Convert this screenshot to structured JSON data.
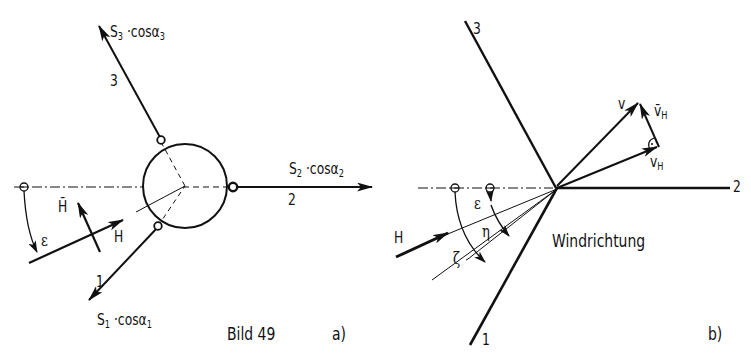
{
  "figure": {
    "caption": "Bild 49",
    "panel_a": {
      "tag": "a)",
      "members": [
        {
          "id": "3",
          "label": "3",
          "force_prefix": "S",
          "force_sub": "3",
          "force_mid": "·cosα",
          "force_sub2": "3"
        },
        {
          "id": "2",
          "label": "2",
          "force_prefix": "S",
          "force_sub": "2",
          "force_mid": "·cosα",
          "force_sub2": "2"
        },
        {
          "id": "1",
          "label": "1",
          "force_prefix": "S",
          "force_sub": "1",
          "force_mid": "·cosα",
          "force_sub2": "1"
        }
      ],
      "load_H": "H",
      "load_H_bar": "H̄",
      "angle_epsilon": "ε"
    },
    "panel_b": {
      "tag": "b)",
      "members": [
        {
          "id": "3",
          "label": "3"
        },
        {
          "id": "2",
          "label": "2"
        },
        {
          "id": "1",
          "label": "1"
        }
      ],
      "vector_v": "v",
      "vector_vH": "v",
      "vector_vH_sub": "H",
      "vector_vH_bar": "v̄",
      "vector_vH_bar_sub": "H",
      "load_H": "H",
      "angle_epsilon": "ε",
      "angle_eta": "η",
      "angle_zeta": "ζ",
      "wind_label": "Windrichtung"
    },
    "colors": {
      "ink": "#111111",
      "background": "#ffffff"
    }
  }
}
